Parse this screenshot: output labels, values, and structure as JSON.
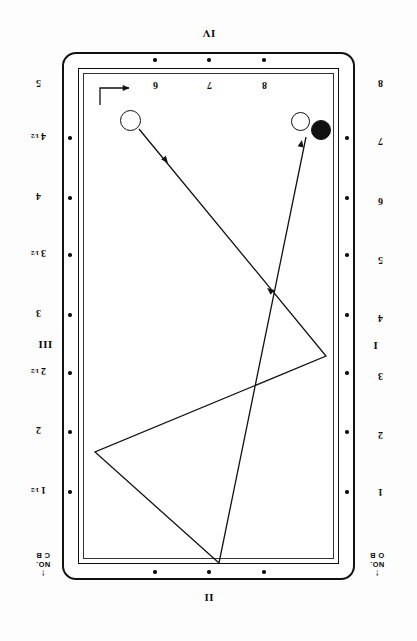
{
  "diagram": {
    "orientation_note": "upside-down",
    "ink_color": "#111111",
    "surface_color": "#ffffff"
  },
  "rails": {
    "top_label": "IV",
    "bottom_label": "II",
    "left_label": "III",
    "right_label": "I"
  },
  "top_numbers": [
    {
      "value": "6",
      "x": 155
    },
    {
      "value": "7",
      "x": 209
    },
    {
      "value": "8",
      "x": 264
    }
  ],
  "left_numbers": [
    {
      "value": "5",
      "y": 85
    },
    {
      "value": "4 1/2",
      "y": 138
    },
    {
      "value": "4",
      "y": 198
    },
    {
      "value": "3 1/2",
      "y": 255
    },
    {
      "value": "3",
      "y": 315
    },
    {
      "value": "2 1/2",
      "y": 373
    },
    {
      "value": "2",
      "y": 432
    },
    {
      "value": "1 1/2",
      "y": 492
    }
  ],
  "right_numbers": [
    {
      "value": "8",
      "y": 85
    },
    {
      "value": "7",
      "y": 143
    },
    {
      "value": "6",
      "y": 203
    },
    {
      "value": "5",
      "y": 262
    },
    {
      "value": "4",
      "y": 320
    },
    {
      "value": "3",
      "y": 378
    },
    {
      "value": "2",
      "y": 437
    },
    {
      "value": "1",
      "y": 494
    }
  ],
  "corner_notes": {
    "left": {
      "line1": "NO.",
      "line2": "C B",
      "arrow": "↑"
    },
    "right": {
      "line1": "NO.",
      "line2": "O B",
      "arrow": "↑"
    }
  },
  "balls": [
    {
      "name": "cue-ball",
      "color": "white",
      "cx": 130,
      "cy": 120,
      "r": 10.5
    },
    {
      "name": "object-ball-1",
      "color": "white",
      "cx": 300,
      "cy": 121,
      "r": 9.5
    },
    {
      "name": "object-ball-2",
      "color": "black",
      "cx": 321,
      "cy": 130,
      "r": 10.0
    }
  ],
  "shot_path": {
    "stroke": "#111111",
    "stroke_width": 1.3,
    "points": [
      {
        "x": 139,
        "y": 129
      },
      {
        "x": 326,
        "y": 356
      },
      {
        "x": 95,
        "y": 452
      },
      {
        "x": 219,
        "y": 563
      },
      {
        "x": 306,
        "y": 137
      }
    ],
    "arrowheads": [
      {
        "x": 168,
        "y": 163,
        "angle": 50
      },
      {
        "x": 267,
        "y": 288,
        "angle": 218
      },
      {
        "x": 302,
        "y": 140,
        "angle": 282
      }
    ]
  },
  "cue_marker": {
    "name": "cue-direction-marker",
    "description": "bracket with right arrow at upper-left of playing surface"
  }
}
